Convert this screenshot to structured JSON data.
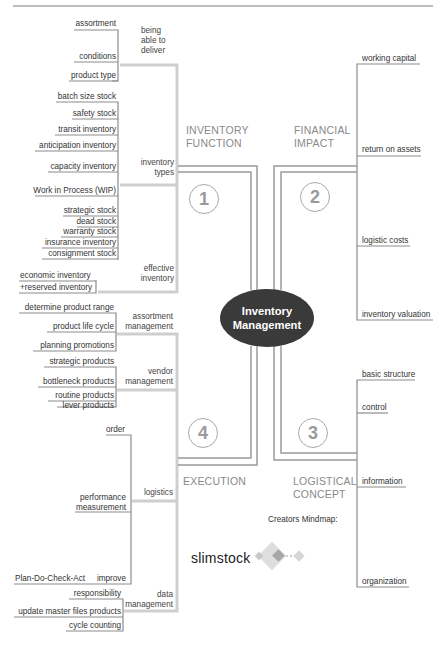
{
  "center": {
    "line1": "Inventory",
    "line2": "Management"
  },
  "quadrants": [
    {
      "number": "1",
      "title_line1": "INVENTORY",
      "title_line2": "FUNCTION",
      "groups": [
        {
          "label_line1": "being",
          "label_line2": "able to",
          "label_line3": "deliver",
          "items": [
            "assortment",
            "conditions",
            "product type"
          ]
        },
        {
          "label_line1": "inventory",
          "label_line2": "types",
          "items": [
            "batch size stock",
            "safety stock",
            "transit inventory",
            "anticipation inventory",
            "capacity inventory",
            "Work in Process (WIP)",
            "strategic stock",
            "dead stock",
            "warranty stock",
            "insurance inventory",
            "consignment stock"
          ]
        },
        {
          "label_line1": "effective",
          "label_line2": "inventory",
          "items": [
            "economic inventory",
            "+reserved inventory"
          ]
        }
      ]
    },
    {
      "number": "2",
      "title_line1": "FINANCIAL",
      "title_line2": "IMPACT",
      "items": [
        "working capital",
        "return on assets",
        "logistic costs",
        "inventory valuation"
      ]
    },
    {
      "number": "3",
      "title_line1": "LOGISTICAL",
      "title_line2": "CONCEPT",
      "items": [
        "basic structure",
        "control",
        "information",
        "organization"
      ]
    },
    {
      "number": "4",
      "title_line1": "EXECUTION",
      "groups": [
        {
          "label_line1": "assortment",
          "label_line2": "management",
          "items": [
            "determine product range",
            "product life cycle",
            "planning promotions"
          ]
        },
        {
          "label_line1": "vendor",
          "label_line2": "management",
          "items": [
            "strategic products",
            "bottleneck products",
            "routine products",
            "lever products"
          ]
        },
        {
          "label_line1": "logistics",
          "items": [
            "order",
            "performance",
            "measurement",
            "Plan-Do-Check-Act",
            "improve"
          ]
        },
        {
          "label_line1": "data",
          "label_line2": "management",
          "items": [
            "responsibility",
            "update master files products",
            "cycle counting"
          ]
        }
      ]
    }
  ],
  "credit": {
    "label": "Creators Mindmap:",
    "brand": "slimstock"
  },
  "colors": {
    "center_fill": "#3a3a3a",
    "line_dark": "#8c8c8c",
    "line_light": "#cfcfcf",
    "category_text": "#8a8a8a"
  }
}
